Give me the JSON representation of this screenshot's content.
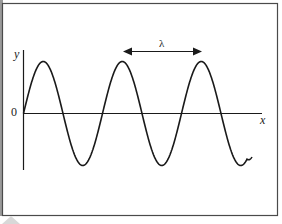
{
  "diagram": {
    "axes": {
      "y_label": "y",
      "x_label": "x",
      "origin_label": "0"
    },
    "annotation": {
      "symbol": "λ",
      "meaning": "wavelength (peak-to-peak distance)"
    },
    "wave": {
      "type": "sine",
      "cycles_shown": 3,
      "period_px": 79,
      "amplitude_px": 52
    },
    "colors": {
      "line": "#1a1a1a",
      "frame": "#444444",
      "background": "#ffffff"
    }
  }
}
